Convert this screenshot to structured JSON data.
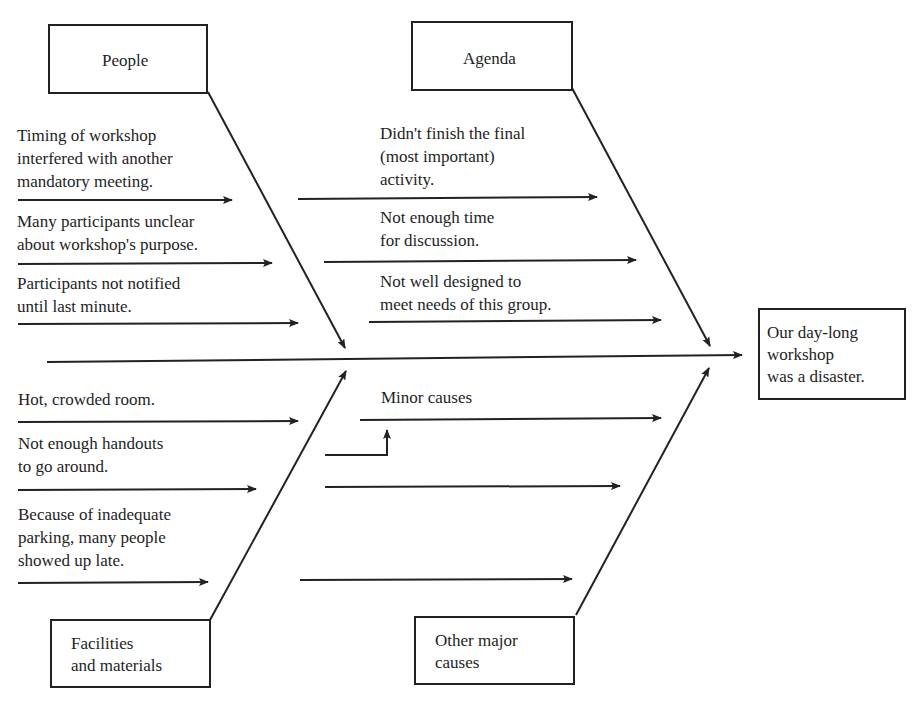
{
  "diagram": {
    "type": "fishbone",
    "effect": {
      "label": "Our day-long\nworkshop\nwas a disaster."
    },
    "categories": [
      {
        "name": "People",
        "causes": [
          "Timing of workshop\ninterfered with another\nmandatory meeting.",
          "Many participants unclear\nabout workshop's purpose.",
          "Participants not notified\nuntil last minute."
        ]
      },
      {
        "name": "Agenda",
        "causes": [
          "Didn't finish the final\n(most important)\nactivity.",
          "Not enough time\nfor discussion.",
          "Not well designed to\nmeet needs of this group."
        ]
      },
      {
        "name": "Facilities\nand materials",
        "causes": [
          "Hot, crowded room.",
          "Not enough handouts\nto go around.",
          "Because of inadequate\nparking, many people\nshowed up late."
        ]
      },
      {
        "name": "Other major\ncauses",
        "causes": [],
        "annotation": "Minor causes"
      }
    ],
    "colors": {
      "line": "#222222",
      "text": "#1e1e1e",
      "background": "#ffffff"
    }
  }
}
